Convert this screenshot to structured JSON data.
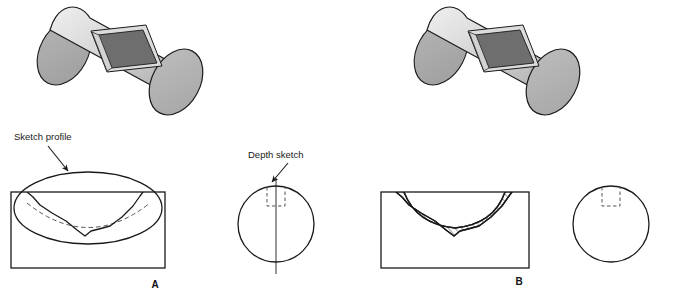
{
  "figure": {
    "background_color": "#ffffff",
    "line_color": "#1a1a1a",
    "labels": {
      "sketch_profile": "Sketch profile",
      "depth_sketch": "Depth sketch"
    },
    "panels": [
      {
        "id": "A",
        "letter": "A",
        "description": "Cylinder with slot, section view showing sketch profile ellipse and swept arc, and end view with depth sketch"
      },
      {
        "id": "B",
        "letter": "B",
        "description": "Cylinder with slot, section view showing hatched removed material, and end view with slot outline"
      }
    ],
    "colors": {
      "cylinder_body_light": "#e8e8e8",
      "cylinder_body_mid": "#c9c9c9",
      "cylinder_body_shadow": "#a8a8a8",
      "end_cap_gray": "#b0b0b0",
      "slot_floor_dark": "#6e6e6e",
      "slot_wall_light": "#dcdcdc",
      "outline": "#1a1a1a",
      "hatch": "#1a1a1a",
      "dashed": "#555555"
    },
    "cylinders": [
      {
        "id": "cylinder-a",
        "x": 18,
        "y": 6
      },
      {
        "id": "cylinder-b",
        "x": 395,
        "y": 6
      }
    ],
    "section_views": [
      {
        "id": "section-a",
        "x": 11,
        "y": 192,
        "width": 154,
        "height": 76,
        "hatched": false
      },
      {
        "id": "section-b",
        "x": 381,
        "y": 192,
        "width": 148,
        "height": 76,
        "hatched": true
      }
    ],
    "end_views": [
      {
        "id": "end-view-a",
        "cx": 276,
        "cy": 224,
        "r": 38,
        "has_centerline": true,
        "has_dashed_slot": true
      },
      {
        "id": "end-view-b",
        "cx": 611,
        "cy": 224,
        "r": 38,
        "has_centerline": false,
        "has_dashed_slot": true
      }
    ]
  }
}
